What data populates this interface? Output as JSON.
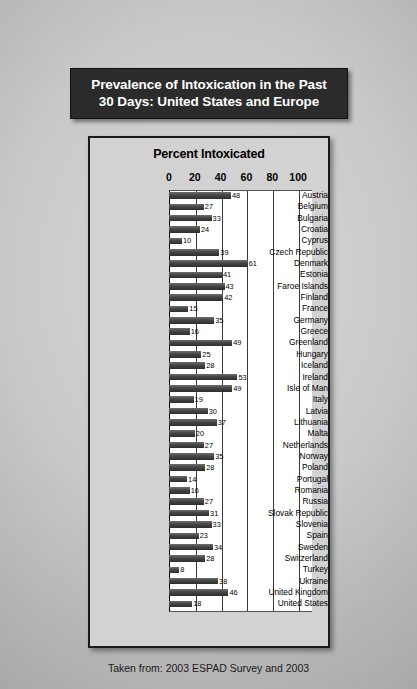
{
  "poster": {
    "title_line1": "Prevalence of Intoxication in the Past",
    "title_line2": "30 Days: United States and Europe",
    "footer": "Taken from: 2003 ESPAD Survey and 2003"
  },
  "colors": {
    "plaque_background": "#2b2b2b",
    "plaque_text": "#ffffff",
    "panel_background": "#d2d2d2",
    "plot_background": "#ffffff",
    "bar_color": "#454545",
    "gridline": "#3a3a3a",
    "page_background": "#c9c9c9"
  },
  "chart_data": {
    "type": "bar",
    "orientation": "horizontal",
    "title": "Percent Intoxicated",
    "xlabel": "",
    "ylabel": "",
    "xlim": [
      0,
      110
    ],
    "xticks": [
      0,
      20,
      40,
      60,
      80,
      100
    ],
    "grid": true,
    "legend": false,
    "categories": [
      "Austria",
      "Belgium",
      "Bulgaria",
      "Croatia",
      "Cyprus",
      "Czech Republic",
      "Denmark",
      "Estonia",
      "Faroe Islands",
      "Finland",
      "France",
      "Germany",
      "Greece",
      "Greenland",
      "Hungary",
      "Iceland",
      "Ireland",
      "Isle of Man",
      "Italy",
      "Latvia",
      "Lithuania",
      "Malta",
      "Netherlands",
      "Norway",
      "Poland",
      "Portugal",
      "Romania",
      "Russia",
      "Slovak Republic",
      "Slovenia",
      "Spain",
      "Sweden",
      "Switzerland",
      "Turkey",
      "Ukraine",
      "United Kingdom",
      "United States"
    ],
    "values": [
      48,
      27,
      33,
      24,
      10,
      39,
      61,
      41,
      43,
      42,
      15,
      35,
      16,
      49,
      25,
      28,
      53,
      49,
      19,
      30,
      37,
      20,
      27,
      35,
      28,
      14,
      16,
      27,
      31,
      33,
      23,
      34,
      28,
      8,
      38,
      46,
      18
    ]
  }
}
